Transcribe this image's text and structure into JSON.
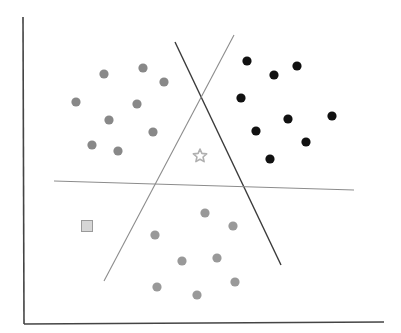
{
  "diagram": {
    "type": "scatter-with-decision-boundaries",
    "colors": {
      "background": "#ffffff",
      "axis": "#444444",
      "boundary_dark": "#3a3a3a",
      "boundary_light": "#8c8c8c",
      "cluster_left": "#888888",
      "cluster_right": "#111111",
      "cluster_bottom": "#999999",
      "star": "#b0b0b0",
      "square_fill": "#d6d6d6",
      "square_stroke": "#9a9a9a"
    },
    "axes": {
      "y_axis": {
        "x1": 23,
        "y1": 17,
        "x2": 24,
        "y2": 324
      },
      "x_axis": {
        "x1": 24,
        "y1": 324,
        "x2": 384,
        "y2": 322
      }
    },
    "boundaries": [
      {
        "name": "dark-diagonal",
        "x1": 175,
        "y1": 42,
        "x2": 281,
        "y2": 265,
        "style": "dark"
      },
      {
        "name": "light-diagonal",
        "x1": 234,
        "y1": 35,
        "x2": 104,
        "y2": 281,
        "style": "light"
      },
      {
        "name": "light-horizontal",
        "x1": 54,
        "y1": 181,
        "x2": 354,
        "y2": 190,
        "style": "light"
      }
    ],
    "clusters": [
      {
        "name": "left",
        "color_key": "cluster_left",
        "points": [
          [
            76,
            102
          ],
          [
            104,
            74
          ],
          [
            143,
            68
          ],
          [
            164,
            82
          ],
          [
            137,
            104
          ],
          [
            109,
            120
          ],
          [
            153,
            132
          ],
          [
            92,
            145
          ],
          [
            118,
            151
          ]
        ]
      },
      {
        "name": "right",
        "color_key": "cluster_right",
        "points": [
          [
            247,
            61
          ],
          [
            274,
            75
          ],
          [
            297,
            66
          ],
          [
            241,
            98
          ],
          [
            288,
            119
          ],
          [
            332,
            116
          ],
          [
            256,
            131
          ],
          [
            306,
            142
          ],
          [
            270,
            159
          ]
        ]
      },
      {
        "name": "bottom",
        "color_key": "cluster_bottom",
        "points": [
          [
            205,
            213
          ],
          [
            233,
            226
          ],
          [
            155,
            235
          ],
          [
            182,
            261
          ],
          [
            217,
            258
          ],
          [
            235,
            282
          ],
          [
            157,
            287
          ],
          [
            197,
            295
          ]
        ]
      }
    ],
    "special_points": {
      "star": {
        "x": 200,
        "y": 156,
        "icon": "star-icon"
      },
      "square": {
        "x": 87,
        "y": 226,
        "size": 11,
        "icon": "square-icon"
      }
    }
  }
}
